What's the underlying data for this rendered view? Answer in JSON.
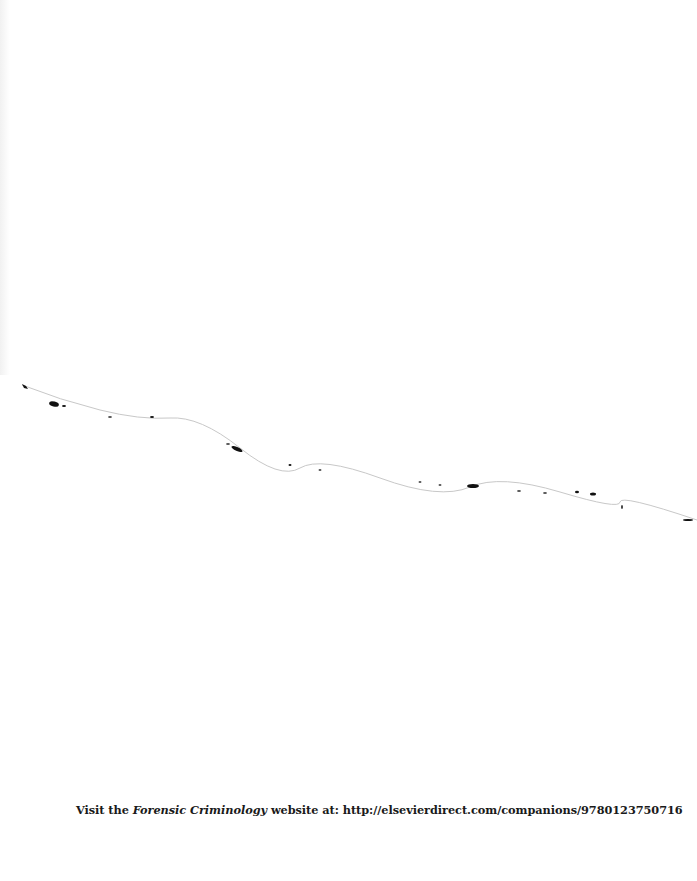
{
  "page": {
    "caption": {
      "prefix": "Visit the ",
      "title": "Forensic Criminology",
      "suffix": " website at: http://elsevierdirect.com/companions/9780123750716"
    },
    "colors": {
      "background": "#ffffff",
      "text": "#1a1a1a",
      "torn_edge": "#111111"
    }
  }
}
